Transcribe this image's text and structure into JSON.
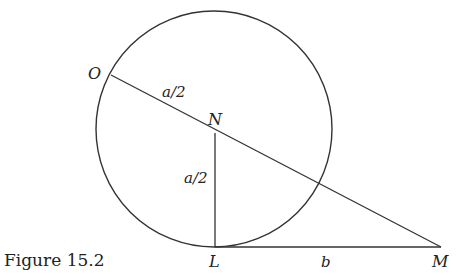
{
  "figure": {
    "caption": "Figure 15.2",
    "stroke_color": "#333333",
    "background": "#ffffff"
  },
  "points": {
    "O": {
      "label": "O",
      "x": 111,
      "y": 75
    },
    "N": {
      "label": "N",
      "x": 215,
      "y": 133
    },
    "L": {
      "label": "L",
      "x": 215,
      "y": 247
    },
    "M": {
      "label": "M",
      "x": 441,
      "y": 247
    }
  },
  "circle": {
    "cx": 214,
    "cy": 129,
    "r": 118
  },
  "segment_labels": {
    "ON": "a/2",
    "NL": "a/2",
    "LM": "b"
  }
}
